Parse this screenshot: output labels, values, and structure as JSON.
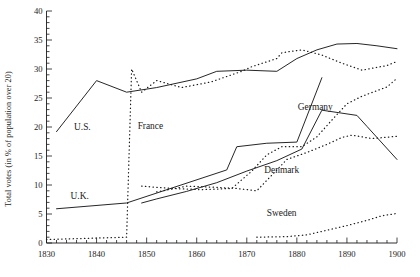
{
  "chart_data": {
    "type": "line",
    "title": "",
    "xlabel": "",
    "ylabel": "Total votes (in % of population over 20)",
    "xlim": [
      1830,
      1900
    ],
    "ylim": [
      0,
      40
    ],
    "xticks": [
      1830,
      1840,
      1850,
      1860,
      1870,
      1880,
      1890,
      1900
    ],
    "xticklabels": [
      "1830",
      "1840",
      "1850",
      "1860",
      "1870",
      "1880",
      "1890",
      "1900"
    ],
    "x_minor_tick_step": 2,
    "yticks": [
      0,
      5,
      10,
      15,
      20,
      25,
      30,
      35,
      40
    ],
    "yticklabels": [
      "0",
      "5",
      "10",
      "15",
      "20",
      "25",
      "30",
      "35",
      "40"
    ],
    "y_minor_tick_step": 1,
    "grid": false,
    "legend_position": "inline-annotations",
    "series": [
      {
        "name": "U.S.",
        "style": "solid",
        "label": "U.S.",
        "label_x": 1835.5,
        "label_y": 19.4,
        "points": [
          [
            1832,
            19.2
          ],
          [
            1840,
            28.0
          ],
          [
            1846,
            26.0
          ],
          [
            1852,
            26.8
          ],
          [
            1860,
            28.3
          ],
          [
            1864,
            29.6
          ],
          [
            1870,
            29.8
          ],
          [
            1876,
            29.6
          ],
          [
            1880,
            31.8
          ],
          [
            1884,
            33.3
          ],
          [
            1888,
            34.3
          ],
          [
            1892,
            34.4
          ],
          [
            1896,
            34.0
          ],
          [
            1900,
            33.5
          ]
        ]
      },
      {
        "name": "France",
        "style": "dotted",
        "label": "France",
        "label_x": 1848.2,
        "label_y": 19.6,
        "points": [
          [
            1830,
            0.6
          ],
          [
            1834,
            0.7
          ],
          [
            1838,
            0.8
          ],
          [
            1842,
            0.9
          ],
          [
            1846,
            1.0
          ],
          [
            1847,
            30.0
          ],
          [
            1849,
            26.0
          ],
          [
            1852,
            28.0
          ],
          [
            1857,
            26.8
          ],
          [
            1863,
            27.8
          ],
          [
            1869,
            29.6
          ],
          [
            1871,
            30.4
          ],
          [
            1876,
            31.8
          ],
          [
            1877,
            32.8
          ],
          [
            1881,
            33.3
          ],
          [
            1885,
            32.4
          ],
          [
            1889,
            31.0
          ],
          [
            1893,
            29.8
          ],
          [
            1898,
            30.6
          ],
          [
            1900,
            31.3
          ]
        ]
      },
      {
        "name": "U.K.",
        "style": "solid",
        "label": "U.K.",
        "label_x": 1834.8,
        "label_y": 7.6,
        "points": [
          [
            1832,
            5.9
          ],
          [
            1846,
            6.9
          ],
          [
            1866,
            12.6
          ],
          [
            1868,
            16.6
          ],
          [
            1874,
            17.2
          ],
          [
            1880,
            17.4
          ],
          [
            1885,
            28.5
          ]
        ]
      },
      {
        "name": "Denmark",
        "style": "solid",
        "label": "Denmark",
        "label_x": 1873.5,
        "label_y": 12.0,
        "points": [
          [
            1849,
            6.9
          ],
          [
            1852,
            7.6
          ],
          [
            1858,
            8.9
          ],
          [
            1864,
            10.4
          ],
          [
            1870,
            12.4
          ],
          [
            1876,
            14.2
          ],
          [
            1881,
            16.2
          ],
          [
            1885,
            22.9
          ],
          [
            1892,
            22.0
          ],
          [
            1894,
            20.1
          ],
          [
            1900,
            14.4
          ]
        ]
      },
      {
        "name": "Germany",
        "style": "dotted",
        "label": "Germany",
        "label_x": 1880.2,
        "label_y": 23.0,
        "points": [
          [
            1849,
            9.8
          ],
          [
            1855,
            9.4
          ],
          [
            1861,
            9.2
          ],
          [
            1867,
            9.4
          ],
          [
            1871,
            12.4
          ],
          [
            1874,
            15.2
          ],
          [
            1877,
            16.6
          ],
          [
            1881,
            16.6
          ],
          [
            1884,
            18.3
          ],
          [
            1887,
            21.2
          ],
          [
            1890,
            24.0
          ],
          [
            1893,
            25.3
          ],
          [
            1898,
            26.9
          ],
          [
            1900,
            28.4
          ]
        ]
      },
      {
        "name": "Denmark-dotted-upper",
        "style": "dotted",
        "label": "",
        "label_x": null,
        "label_y": null,
        "points": [
          [
            1852,
            8.8
          ],
          [
            1858,
            9.8
          ],
          [
            1864,
            9.6
          ],
          [
            1868,
            9.4
          ],
          [
            1872,
            9.0
          ],
          [
            1878,
            14.4
          ],
          [
            1882,
            15.6
          ],
          [
            1886,
            17.0
          ],
          [
            1889,
            18.2
          ],
          [
            1891,
            18.6
          ],
          [
            1895,
            18.0
          ],
          [
            1900,
            18.4
          ]
        ]
      },
      {
        "name": "Sweden",
        "style": "dotted",
        "label": "Sweden",
        "label_x": 1874.0,
        "label_y": 4.6,
        "points": [
          [
            1872,
            1.0
          ],
          [
            1878,
            1.1
          ],
          [
            1882,
            1.4
          ],
          [
            1886,
            2.2
          ],
          [
            1890,
            3.0
          ],
          [
            1894,
            3.9
          ],
          [
            1897,
            4.7
          ],
          [
            1900,
            5.1
          ]
        ]
      }
    ],
    "annotations": [
      {
        "text": "U.S.",
        "x": 1835.5,
        "y": 19.4
      },
      {
        "text": "France",
        "x": 1848.2,
        "y": 19.6
      },
      {
        "text": "U.K.",
        "x": 1834.8,
        "y": 7.6
      },
      {
        "text": "Germany",
        "x": 1880.2,
        "y": 23.0
      },
      {
        "text": "Denmark",
        "x": 1873.5,
        "y": 12.0
      },
      {
        "text": "Sweden",
        "x": 1874.0,
        "y": 4.6
      }
    ],
    "colors": {
      "line": "#1a1a1a",
      "background": "#ffffff",
      "text": "#1a1a1a"
    }
  }
}
